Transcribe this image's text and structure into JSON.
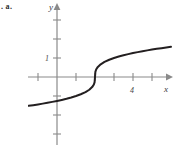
{
  "item_marker": ". a.",
  "figure": {
    "name": "cube-root-curve-graph",
    "axis_color": "#8a8a8a",
    "curve_color": "#231f20",
    "label_color": "#3a3a3a",
    "background": "#ffffff"
  },
  "chart_data": {
    "type": "line",
    "title": "",
    "subtitle": "",
    "xlabel": "x",
    "ylabel": "y",
    "annotations": [],
    "legend": [],
    "legend_position": "none",
    "grid": false,
    "axis_arrows": true,
    "xlim": [
      -1.5,
      6.0
    ],
    "ylim": [
      -4.0,
      4.0
    ],
    "xticks": [
      -1,
      1,
      2,
      3,
      4,
      5
    ],
    "yticks": [
      -3,
      -2,
      -1,
      1,
      2,
      3
    ],
    "xtick_labels": [
      {
        "value": 4,
        "text": "4"
      }
    ],
    "ytick_labels": [
      {
        "value": 1,
        "text": "1"
      }
    ],
    "equation": "y = (x - 2)^(1/3)",
    "x_intercept": 2,
    "vertical_tangent_at": 2,
    "series": [
      {
        "name": "y = cube root of (x - 2)",
        "x": [
          -1.5,
          -1.25,
          -1.0,
          -0.75,
          -0.5,
          -0.25,
          0.0,
          0.25,
          0.5,
          0.75,
          1.0,
          1.25,
          1.5,
          1.7,
          1.85,
          1.94,
          1.98,
          2.0,
          2.02,
          2.06,
          2.15,
          2.3,
          2.5,
          2.75,
          3.0,
          3.25,
          3.5,
          3.75,
          4.0,
          4.25,
          4.5,
          4.75,
          5.0,
          5.25,
          5.5,
          5.75,
          6.0
        ],
        "y": [
          -1.518,
          -1.481,
          -1.442,
          -1.401,
          -1.357,
          -1.31,
          -1.26,
          -1.205,
          -1.145,
          -1.077,
          -1.0,
          -0.909,
          -0.794,
          -0.67,
          -0.531,
          -0.394,
          -0.271,
          0.0,
          0.271,
          0.392,
          0.531,
          0.669,
          0.794,
          0.909,
          1.0,
          1.077,
          1.145,
          1.205,
          1.26,
          1.31,
          1.357,
          1.401,
          1.442,
          1.481,
          1.518,
          1.554,
          1.587
        ]
      }
    ]
  },
  "labels": {
    "y_axis": "y",
    "x_axis": "x",
    "y_one": "1",
    "x_four": "4"
  }
}
